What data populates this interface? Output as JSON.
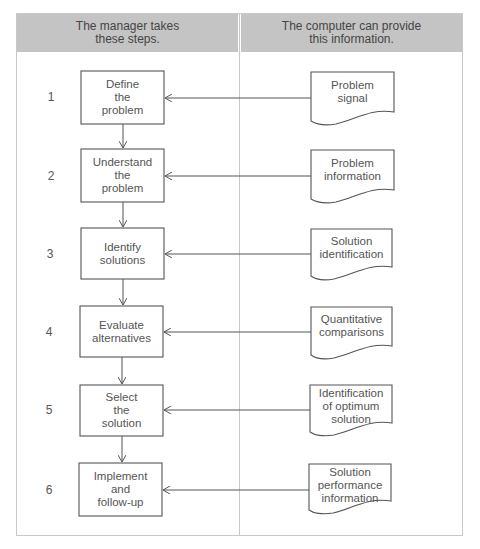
{
  "headers": {
    "left": "The manager takes\nthese steps.",
    "right": "The computer can provide\nthis information."
  },
  "steps": [
    {
      "number": "1",
      "action": "Define\nthe\nproblem",
      "info": "Problem\nsignal"
    },
    {
      "number": "2",
      "action": "Understand\nthe\nproblem",
      "info": "Problem\ninformation"
    },
    {
      "number": "3",
      "action": "Identify\nsolutions",
      "info": "Solution\nidentification"
    },
    {
      "number": "4",
      "action": "Evaluate\nalternatives",
      "info": "Quantitative\ncomparisons"
    },
    {
      "number": "5",
      "action": "Select\nthe\nsolution",
      "info": "Identification\nof optimum\nsolution"
    },
    {
      "number": "6",
      "action": "Implement\nand\nfollow-up",
      "info": "Solution\nperformance\ninformation"
    }
  ],
  "colors": {
    "header_bg": "#c4c4c4",
    "line": "#555555",
    "frame": "#c8c8c8"
  }
}
